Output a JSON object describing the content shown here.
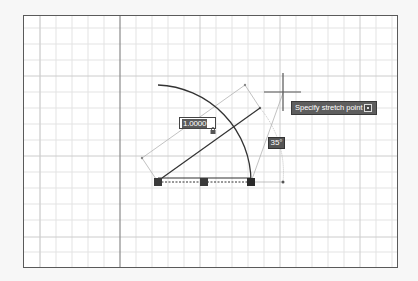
{
  "canvas": {
    "background": "#ffffff",
    "grid_minor_color": "#e2e2e2",
    "grid_major_color": "#cfcfcf",
    "axis_color": "#8a8a8a",
    "frame_color": "#5a5a5a"
  },
  "dynamic_input": {
    "length_value": "1.0000",
    "angle_value": "35°",
    "prompt_text": "Specify stretch point or",
    "prompt_icon": "arrow-down-options-icon"
  },
  "grips": [
    {
      "x": 158,
      "y": 182,
      "role": "start"
    },
    {
      "x": 204,
      "y": 182,
      "role": "midpoint"
    },
    {
      "x": 251,
      "y": 182,
      "role": "end"
    }
  ],
  "crosshair": {
    "x": 283,
    "y": 93
  },
  "colors": {
    "geometry": "#333333",
    "construction": "#9a9a9a",
    "grip": "#3a3a3a",
    "tooltip_bg": "#5e5e5e",
    "label_text": "#ffffff"
  }
}
